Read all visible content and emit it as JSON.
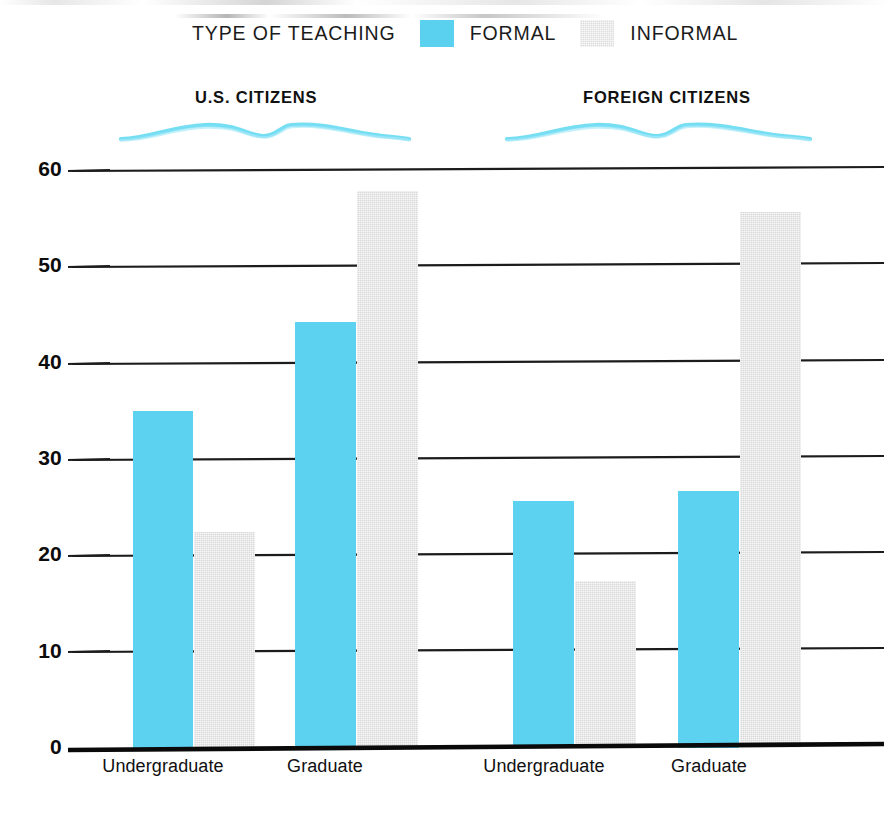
{
  "legend": {
    "title": "TYPE OF TEACHING",
    "items": [
      {
        "label": "FORMAL",
        "color": "#5cd2f0",
        "key": "formal"
      },
      {
        "label": "INFORMAL",
        "color": "#d9d9d9",
        "key": "informal"
      }
    ]
  },
  "groups": [
    {
      "label": "U.S. CITIZENS"
    },
    {
      "label": "FOREIGN CITIZENS"
    }
  ],
  "axis": {
    "y_ticks": [
      "0",
      "10",
      "20",
      "30",
      "40",
      "50",
      "60"
    ],
    "x_ticks": [
      "Undergraduate",
      "Graduate",
      "Undergraduate",
      "Graduate"
    ]
  },
  "chart_data": {
    "type": "bar",
    "title": "TYPE OF TEACHING",
    "xlabel": "",
    "ylabel": "",
    "ylim": [
      0,
      60
    ],
    "yticks": [
      0,
      10,
      20,
      30,
      40,
      50,
      60
    ],
    "grid": true,
    "legend_position": "top",
    "group_labels": [
      "U.S. CITIZENS",
      "FOREIGN CITIZENS"
    ],
    "categories": [
      "U.S. CITIZENS - Undergraduate",
      "U.S. CITIZENS - Graduate",
      "FOREIGN CITIZENS - Undergraduate",
      "FOREIGN CITIZENS - Graduate"
    ],
    "series": [
      {
        "name": "FORMAL",
        "color": "#5cd2f0",
        "values": [
          35.0,
          44.2,
          25.6,
          26.7
        ]
      },
      {
        "name": "INFORMAL",
        "color": "#d9d9d9",
        "values": [
          22.4,
          57.8,
          17.3,
          55.6
        ]
      }
    ]
  },
  "bars": [
    {
      "name": "us-undergraduate-formal",
      "series": "formal",
      "value": 35.0,
      "x": 133,
      "width": 60
    },
    {
      "name": "us-undergraduate-informal",
      "series": "informal",
      "value": 22.4,
      "x": 194,
      "width": 61
    },
    {
      "name": "us-graduate-formal",
      "series": "formal",
      "value": 44.2,
      "x": 295,
      "width": 61
    },
    {
      "name": "us-graduate-informal",
      "series": "informal",
      "value": 57.8,
      "x": 357,
      "width": 61
    },
    {
      "name": "foreign-undergraduate-formal",
      "series": "formal",
      "value": 25.6,
      "x": 513,
      "width": 61
    },
    {
      "name": "foreign-undergraduate-informal",
      "series": "informal",
      "value": 17.3,
      "x": 575,
      "width": 61
    },
    {
      "name": "foreign-graduate-formal",
      "series": "formal",
      "value": 26.7,
      "x": 678,
      "width": 61
    },
    {
      "name": "foreign-graduate-informal",
      "series": "informal",
      "value": 55.6,
      "x": 740,
      "width": 61
    }
  ],
  "xtick_positions": [
    163,
    325,
    544,
    709
  ]
}
